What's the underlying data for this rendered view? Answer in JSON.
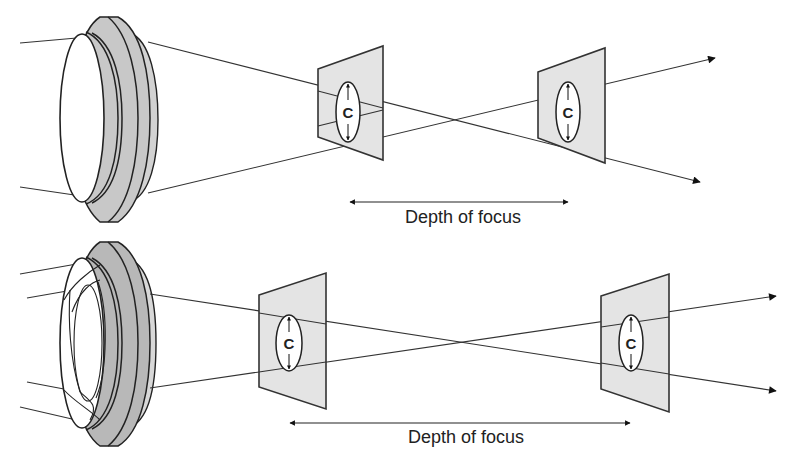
{
  "diagram": {
    "title": "",
    "panels": [
      {
        "name": "large-aperture",
        "planes": [
          {
            "circle_label": "C"
          },
          {
            "circle_label": "C"
          }
        ],
        "dimension_label": "Depth of focus"
      },
      {
        "name": "small-aperture",
        "planes": [
          {
            "circle_label": "C"
          },
          {
            "circle_label": "C"
          }
        ],
        "dimension_label": "Depth of focus"
      }
    ],
    "colors": {
      "lens_barrel": "#c8c8c8",
      "lens_barrel_dark": "#b4b4b4",
      "plane_fill": "#e4e4e4",
      "line": "#333333"
    }
  }
}
